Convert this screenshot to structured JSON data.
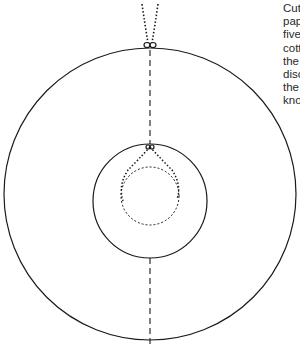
{
  "caption": {
    "lines": [
      "Cut",
      "pap",
      "five",
      "cott",
      "the",
      "disc",
      "the",
      "kno"
    ]
  },
  "diagram": {
    "stroke_color": "#1a1a1a",
    "outer_disc": {
      "cx": 150,
      "cy": 194,
      "r": 146
    },
    "inner_circle": {
      "cx": 150,
      "cy": 201,
      "r": 57
    },
    "dotted_circle": {
      "cx": 150,
      "cy": 196,
      "r": 29
    },
    "center_line": {
      "x": 150,
      "y1": 48,
      "y2": 346
    },
    "top_knot": {
      "x": 150,
      "y": 44
    },
    "inner_knot": {
      "x": 150,
      "y": 146
    }
  }
}
